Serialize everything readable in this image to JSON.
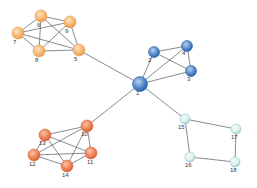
{
  "diagram": {
    "type": "network-graph",
    "groups": {
      "orange": {
        "fill": "#f4b26a",
        "highlight": "#fde3c2",
        "stroke": "#e89a48"
      },
      "blue": {
        "fill": "#4a7fc4",
        "highlight": "#b8d2f0",
        "stroke": "#2f64ab"
      },
      "red": {
        "fill": "#ec7a4e",
        "highlight": "#fbc2a6",
        "stroke": "#d9633a"
      },
      "cyan": {
        "fill": "#d8f0ee",
        "highlight": "#f4fbfa",
        "stroke": "#9ccac6"
      }
    },
    "nodes": [
      {
        "id": "1",
        "label": "1",
        "x": 140,
        "y": 84,
        "r": 7.5,
        "group": "blue",
        "lx": -4,
        "ly": 11
      },
      {
        "id": "2",
        "label": "2",
        "x": 154,
        "y": 52,
        "r": 5.5,
        "group": "blue",
        "lx": -6,
        "ly": 10
      },
      {
        "id": "3",
        "label": "3",
        "x": 191,
        "y": 71,
        "r": 5.5,
        "group": "blue",
        "lx": -4,
        "ly": 10
      },
      {
        "id": "4",
        "label": "4",
        "x": 187,
        "y": 46,
        "r": 5.5,
        "group": "blue",
        "lx": -5,
        "ly": 9
      },
      {
        "id": "5",
        "label": "5",
        "x": 79,
        "y": 50,
        "r": 6,
        "group": "orange",
        "lx": -5,
        "ly": 11
      },
      {
        "id": "6",
        "label": "6",
        "x": 41,
        "y": 16,
        "r": 6,
        "group": "orange",
        "lx": -4,
        "ly": 11
      },
      {
        "id": "7",
        "label": "7",
        "x": 18,
        "y": 33,
        "r": 6,
        "group": "orange",
        "lx": -5,
        "ly": 11
      },
      {
        "id": "8",
        "label": "8",
        "x": 39,
        "y": 51,
        "r": 6,
        "group": "orange",
        "lx": -4,
        "ly": 11
      },
      {
        "id": "9",
        "label": "9",
        "x": 70,
        "y": 22,
        "r": 6,
        "group": "orange",
        "lx": -5,
        "ly": 11
      },
      {
        "id": "10",
        "label": "10",
        "x": 87,
        "y": 126,
        "r": 6,
        "group": "red",
        "lx": -6,
        "ly": 10
      },
      {
        "id": "11",
        "label": "11",
        "x": 91,
        "y": 153,
        "r": 6,
        "group": "red",
        "lx": -4,
        "ly": 11
      },
      {
        "id": "12",
        "label": "12",
        "x": 34,
        "y": 155,
        "r": 6,
        "group": "red",
        "lx": -5,
        "ly": 11
      },
      {
        "id": "13",
        "label": "13",
        "x": 45,
        "y": 135,
        "r": 6,
        "group": "red",
        "lx": -6,
        "ly": 10
      },
      {
        "id": "14",
        "label": "14",
        "x": 67,
        "y": 166,
        "r": 6,
        "group": "red",
        "lx": -5,
        "ly": 11
      },
      {
        "id": "15",
        "label": "15",
        "x": 185,
        "y": 119,
        "r": 5,
        "group": "cyan",
        "lx": -7,
        "ly": 10
      },
      {
        "id": "16",
        "label": "16",
        "x": 190,
        "y": 157,
        "r": 5,
        "group": "cyan",
        "lx": -5,
        "ly": 10
      },
      {
        "id": "17",
        "label": "17",
        "x": 236,
        "y": 129,
        "r": 5,
        "group": "cyan",
        "lx": -5,
        "ly": 10
      },
      {
        "id": "18",
        "label": "18",
        "x": 235,
        "y": 162,
        "r": 5,
        "group": "cyan",
        "lx": -5,
        "ly": 10
      }
    ],
    "edges": [
      [
        "1",
        "2"
      ],
      [
        "1",
        "3"
      ],
      [
        "1",
        "4"
      ],
      [
        "2",
        "4"
      ],
      [
        "2",
        "3"
      ],
      [
        "4",
        "3"
      ],
      [
        "1",
        "5"
      ],
      [
        "1",
        "10"
      ],
      [
        "1",
        "15"
      ],
      [
        "5",
        "6"
      ],
      [
        "5",
        "7"
      ],
      [
        "5",
        "8"
      ],
      [
        "5",
        "9"
      ],
      [
        "6",
        "7"
      ],
      [
        "6",
        "8"
      ],
      [
        "6",
        "9"
      ],
      [
        "7",
        "8"
      ],
      [
        "7",
        "9"
      ],
      [
        "8",
        "9"
      ],
      [
        "10",
        "11"
      ],
      [
        "10",
        "12"
      ],
      [
        "10",
        "13"
      ],
      [
        "10",
        "14"
      ],
      [
        "11",
        "12"
      ],
      [
        "11",
        "13"
      ],
      [
        "11",
        "14"
      ],
      [
        "12",
        "13"
      ],
      [
        "12",
        "14"
      ],
      [
        "13",
        "14"
      ],
      [
        "15",
        "16"
      ],
      [
        "15",
        "17"
      ],
      [
        "16",
        "18"
      ],
      [
        "17",
        "18"
      ]
    ]
  }
}
